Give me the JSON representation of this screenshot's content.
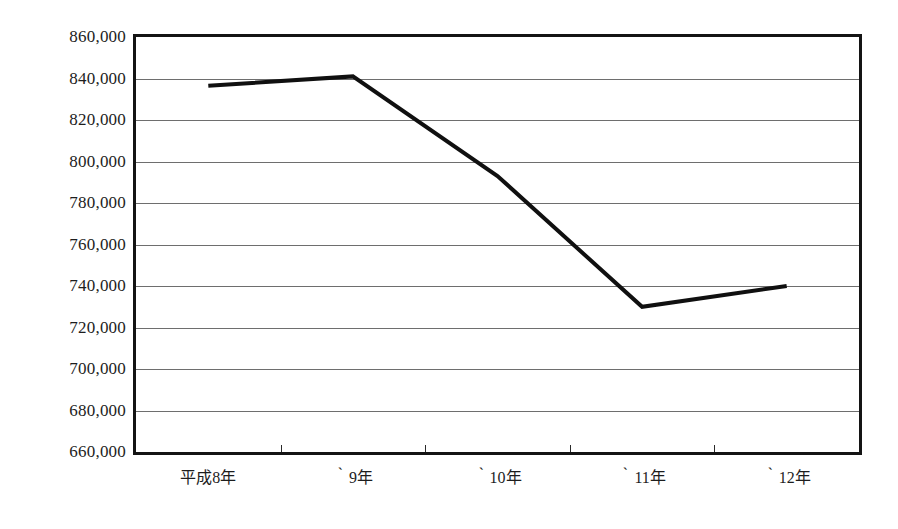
{
  "chart_data": {
    "type": "line",
    "title": "",
    "subtitle": "",
    "xlabel": "",
    "ylabel": "",
    "categories": [
      "平成8年",
      "‵9年",
      "‵10年",
      "‵11年",
      "‵12年"
    ],
    "values": [
      836500,
      841000,
      793000,
      730000,
      740000
    ],
    "series": [
      {
        "name": "",
        "values": [
          836500,
          841000,
          793000,
          730000,
          740000
        ]
      }
    ],
    "ylim": [
      660000,
      860000
    ],
    "ytick_step": 20000,
    "yticks": [
      860000,
      840000,
      820000,
      800000,
      780000,
      760000,
      740000,
      720000,
      700000,
      680000,
      660000
    ],
    "ytick_labels": [
      "860,000",
      "840,000",
      "820,000",
      "800,000",
      "780,000",
      "760,000",
      "740,000",
      "720,000",
      "700,000",
      "680,000",
      "660,000"
    ],
    "grid": {
      "horizontal": true,
      "vertical": false,
      "color": "#6e6e6e"
    },
    "legend": {
      "visible": false,
      "position": "none",
      "entries": []
    },
    "line": {
      "color": "#101010",
      "width": 4,
      "markers": false
    },
    "axis": {
      "frame_color": "#141414",
      "frame_width": 3,
      "x_tick_count": 4
    },
    "annotations": []
  }
}
